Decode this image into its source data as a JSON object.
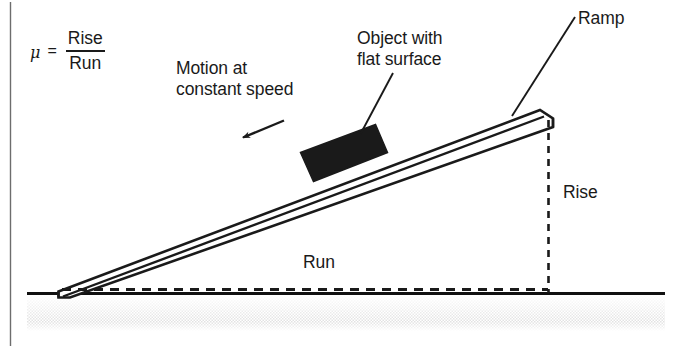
{
  "figure": {
    "kind": "physics-diagram",
    "background_color": "#ffffff",
    "ink_color": "#1a1a1a",
    "border": {
      "left_rule_color": "#5a5a5a"
    }
  },
  "formula": {
    "mu_symbol": "μ",
    "equals": "=",
    "numerator": "Rise",
    "denominator": "Run"
  },
  "labels": {
    "motion": "Motion at\nconstant speed",
    "object": "Object with\nflat surface",
    "ramp": "Ramp",
    "rise": "Rise",
    "run": "Run"
  },
  "elements": {
    "block": {
      "name": "object-block",
      "fill": "#1a1a1a"
    },
    "ramp": {
      "name": "inclined-ramp",
      "fill": "#ffffff",
      "stroke": "#1a1a1a"
    },
    "ground": {
      "name": "ground-surface",
      "line_color": "#111111",
      "stipple_color": "#b8b8b8"
    },
    "motion_arrow": {
      "name": "motion-arrow",
      "direction": "down-left"
    },
    "rise_line": {
      "name": "rise-dashed-line",
      "style": "dashed"
    },
    "run_line": {
      "name": "run-dashed-line",
      "style": "dashed"
    }
  }
}
